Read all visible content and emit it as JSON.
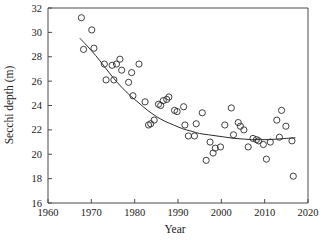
{
  "figure": {
    "background_color": "#ffffff",
    "point_color": "#2b2b2b",
    "curve_color": "#2b2b2b",
    "axis_color": "#4a4a4a"
  },
  "chart_data": {
    "type": "scatter",
    "title": "",
    "xlabel": "Year",
    "ylabel": "Secchi depth (m)",
    "xlim": [
      1960,
      2020
    ],
    "ylim": [
      16,
      32
    ],
    "xticks": [
      1960,
      1970,
      1980,
      1990,
      2000,
      2010,
      2020
    ],
    "xtick_labels": [
      "1960",
      "1970",
      "1980",
      "1990",
      "2000",
      "2010",
      "2020"
    ],
    "yticks": [
      16,
      18,
      20,
      22,
      24,
      26,
      28,
      30,
      32
    ],
    "ytick_labels": [
      "16",
      "18",
      "20",
      "22",
      "24",
      "26",
      "28",
      "30",
      "32"
    ],
    "grid": false,
    "legend": null,
    "marker": "open-circle",
    "marker_size": 3.1,
    "points": [
      [
        1967.7,
        31.2
      ],
      [
        1968.2,
        28.6
      ],
      [
        1970.1,
        30.2
      ],
      [
        1970.6,
        28.7
      ],
      [
        1973.0,
        27.4
      ],
      [
        1973.4,
        26.1
      ],
      [
        1974.8,
        27.3
      ],
      [
        1975.2,
        26.1
      ],
      [
        1975.8,
        27.4
      ],
      [
        1976.6,
        27.8
      ],
      [
        1977.0,
        26.9
      ],
      [
        1978.6,
        25.9
      ],
      [
        1979.3,
        26.7
      ],
      [
        1979.6,
        24.8
      ],
      [
        1981.0,
        27.4
      ],
      [
        1982.4,
        24.3
      ],
      [
        1983.2,
        22.4
      ],
      [
        1983.7,
        22.5
      ],
      [
        1984.5,
        22.8
      ],
      [
        1985.5,
        24.1
      ],
      [
        1986.0,
        24.0
      ],
      [
        1986.6,
        24.4
      ],
      [
        1987.4,
        24.5
      ],
      [
        1987.9,
        24.7
      ],
      [
        1989.2,
        23.6
      ],
      [
        1989.8,
        23.5
      ],
      [
        1991.3,
        23.9
      ],
      [
        1991.6,
        22.4
      ],
      [
        1992.4,
        21.5
      ],
      [
        1993.8,
        21.5
      ],
      [
        1994.2,
        22.5
      ],
      [
        1995.6,
        23.4
      ],
      [
        1996.5,
        19.5
      ],
      [
        1997.4,
        21.0
      ],
      [
        1998.1,
        20.1
      ],
      [
        1998.6,
        20.5
      ],
      [
        1999.8,
        20.6
      ],
      [
        2000.8,
        22.4
      ],
      [
        2002.3,
        23.8
      ],
      [
        2002.8,
        21.6
      ],
      [
        2003.9,
        22.6
      ],
      [
        2004.4,
        22.3
      ],
      [
        2005.2,
        22.0
      ],
      [
        2006.2,
        20.6
      ],
      [
        2007.3,
        21.3
      ],
      [
        2008.1,
        21.2
      ],
      [
        2008.6,
        21.1
      ],
      [
        2009.7,
        20.8
      ],
      [
        2010.4,
        19.6
      ],
      [
        2011.3,
        21.0
      ],
      [
        2012.8,
        22.8
      ],
      [
        2013.4,
        21.4
      ],
      [
        2013.9,
        23.6
      ],
      [
        2014.9,
        22.3
      ],
      [
        2016.3,
        21.1
      ],
      [
        2016.6,
        18.2
      ]
    ],
    "fit_curve": {
      "name": "fitted trend",
      "points": [
        [
          1967.4,
          29.5
        ],
        [
          1969.0,
          28.9
        ],
        [
          1971.0,
          28.1
        ],
        [
          1973.0,
          27.2
        ],
        [
          1975.0,
          26.3
        ],
        [
          1977.0,
          25.5
        ],
        [
          1979.0,
          24.8
        ],
        [
          1981.0,
          24.2
        ],
        [
          1983.0,
          23.6
        ],
        [
          1985.0,
          23.1
        ],
        [
          1987.0,
          22.7
        ],
        [
          1989.0,
          22.4
        ],
        [
          1991.0,
          22.1
        ],
        [
          1993.0,
          21.9
        ],
        [
          1995.0,
          21.7
        ],
        [
          1997.0,
          21.6
        ],
        [
          1999.0,
          21.5
        ],
        [
          2001.0,
          21.4
        ],
        [
          2003.0,
          21.3
        ],
        [
          2005.0,
          21.25
        ],
        [
          2007.0,
          21.2
        ],
        [
          2009.0,
          21.2
        ],
        [
          2011.0,
          21.2
        ],
        [
          2013.0,
          21.25
        ],
        [
          2015.0,
          21.3
        ],
        [
          2017.0,
          21.35
        ]
      ]
    }
  }
}
